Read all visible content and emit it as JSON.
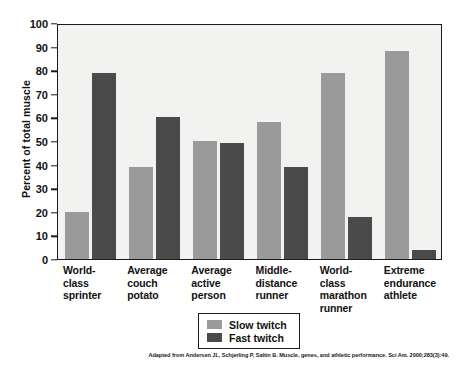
{
  "chart_data": {
    "type": "bar",
    "title": "",
    "subtitle": "",
    "xlabel": "",
    "ylabel": "Percent of total muscle",
    "ylim": [
      0,
      100
    ],
    "yticks": [
      0,
      10,
      20,
      30,
      40,
      50,
      60,
      70,
      80,
      90,
      100
    ],
    "grid": false,
    "legend_position": "bottom-center",
    "categories": [
      "World-class sprinter",
      "Average couch potato",
      "Average active person",
      "Middle-distance runner",
      "World-class marathon runner",
      "Extreme endurance athlete"
    ],
    "category_lines": [
      [
        "World-",
        "class",
        "sprinter"
      ],
      [
        "Average",
        "couch",
        "potato"
      ],
      [
        "Average",
        "active",
        "person"
      ],
      [
        "Middle-",
        "distance",
        "runner"
      ],
      [
        "World-",
        "class",
        "marathon",
        "runner"
      ],
      [
        "Extreme",
        "endurance",
        "athlete"
      ]
    ],
    "series": [
      {
        "name": "Slow twitch",
        "color": "#9a9a9a",
        "values": [
          20,
          39,
          50,
          58,
          79,
          88
        ]
      },
      {
        "name": "Fast twitch",
        "color": "#4a4a4a",
        "values": [
          79,
          60,
          49,
          39,
          18,
          4
        ]
      }
    ]
  },
  "legend": {
    "items": [
      {
        "label": "Slow twitch",
        "color": "#9a9a9a"
      },
      {
        "label": "Fast twitch",
        "color": "#4a4a4a"
      }
    ]
  },
  "source_note": "Adapted from Andersen JL, Schjerling P, Saltin B. Muscle, genes, and athletic performance. Sci Am. 2000;283(3):49.",
  "colors": {
    "slow_twitch": "#9a9a9a",
    "fast_twitch": "#4a4a4a",
    "plot_background": "#f2f2f0",
    "axis": "#1a1a1a",
    "text": "#111111"
  }
}
